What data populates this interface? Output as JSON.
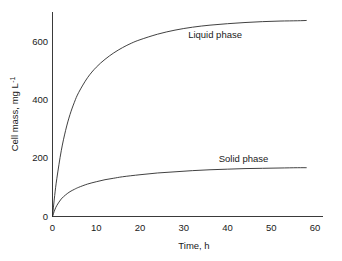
{
  "chart_data": {
    "type": "line",
    "title": "",
    "xlabel": "Time, h",
    "ylabel": "Cell mass, mg L",
    "ylabel_superscript": "-1",
    "xlim": [
      0,
      65
    ],
    "ylim": [
      0,
      700
    ],
    "xticks": [
      0,
      10,
      20,
      30,
      40,
      50,
      60
    ],
    "xtick_labels": [
      "0",
      "10",
      "20",
      "30",
      "40",
      "50",
      "60"
    ],
    "yticks": [
      0,
      200,
      400,
      600
    ],
    "ytick_labels": [
      "0",
      "200",
      "400",
      "600"
    ],
    "grid": false,
    "legend": "inline-annotations",
    "series": [
      {
        "name": "Liquid phase",
        "label": "Liquid phase",
        "color": "#2b2b2b",
        "annotation_x": 31,
        "annotation_y": 612,
        "x": [
          0,
          0.5,
          1,
          2,
          3,
          4,
          5,
          6,
          8,
          10,
          12,
          14,
          16,
          18,
          20,
          24,
          28,
          32,
          36,
          40,
          44,
          48,
          52,
          56,
          58
        ],
        "y": [
          0,
          72,
          131,
          225,
          295,
          349,
          391,
          425,
          475,
          511,
          538,
          560,
          578,
          593,
          605,
          624,
          638,
          648,
          655,
          660,
          664,
          667,
          669,
          670,
          671
        ]
      },
      {
        "name": "Solid phase",
        "label": "Solid phase",
        "color": "#2b2b2b",
        "annotation_x": 38,
        "annotation_y": 188,
        "x": [
          0,
          0.5,
          1,
          2,
          3,
          4,
          5,
          6,
          8,
          10,
          12,
          14,
          16,
          20,
          24,
          28,
          32,
          36,
          40,
          44,
          48,
          52,
          56,
          58
        ],
        "y": [
          0,
          22,
          38,
          60,
          74,
          85,
          93,
          100,
          111,
          119,
          126,
          131,
          136,
          143,
          149,
          153,
          157,
          160,
          162,
          164,
          165,
          166,
          167,
          167
        ]
      }
    ]
  }
}
